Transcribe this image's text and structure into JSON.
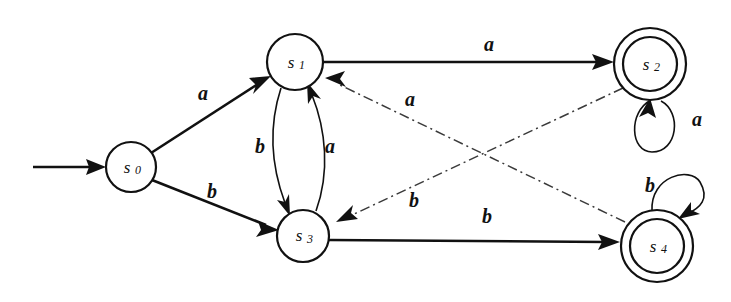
{
  "diagram": {
    "type": "state-transition-diagram",
    "alphabet": [
      "a",
      "b"
    ],
    "start_state": "s0",
    "accepting_states": [
      "s2",
      "s4"
    ]
  },
  "states": [
    {
      "id": "s0",
      "base": "s",
      "sub": "0",
      "cx": 131,
      "cy": 167,
      "r": 25,
      "accepting": false,
      "start": true
    },
    {
      "id": "s1",
      "base": "s",
      "sub": "1",
      "cx": 295,
      "cy": 62,
      "r": 28,
      "accepting": false,
      "start": false
    },
    {
      "id": "s2",
      "base": "s",
      "sub": "2",
      "cx": 650,
      "cy": 64,
      "r": 36,
      "accepting": true,
      "start": false
    },
    {
      "id": "s3",
      "base": "s",
      "sub": "3",
      "cx": 303,
      "cy": 236,
      "r": 26,
      "accepting": false,
      "start": false
    },
    {
      "id": "s4",
      "base": "s",
      "sub": "4",
      "cx": 657,
      "cy": 246,
      "r": 36,
      "accepting": true,
      "start": false
    }
  ],
  "transitions": [
    {
      "id": "t-s0-s1",
      "from": "s0",
      "to": "s1",
      "symbol": "a",
      "style": "solid",
      "shape": "straight",
      "label_x": 203,
      "label_y": 93
    },
    {
      "id": "t-s0-s3",
      "from": "s0",
      "to": "s3",
      "symbol": "b",
      "style": "solid",
      "shape": "straight",
      "label_x": 212,
      "label_y": 191
    },
    {
      "id": "t-s1-s2",
      "from": "s1",
      "to": "s2",
      "symbol": "a",
      "style": "solid",
      "shape": "straight",
      "label_x": 489,
      "label_y": 44
    },
    {
      "id": "t-s1-s3",
      "from": "s1",
      "to": "s3",
      "symbol": "b",
      "style": "thin",
      "shape": "curve-left",
      "label_x": 260,
      "label_y": 146
    },
    {
      "id": "t-s3-s1",
      "from": "s3",
      "to": "s1",
      "symbol": "a",
      "style": "thin",
      "shape": "curve-right",
      "label_x": 330,
      "label_y": 146
    },
    {
      "id": "t-s3-s4",
      "from": "s3",
      "to": "s4",
      "symbol": "b",
      "style": "solid",
      "shape": "straight",
      "label_x": 487,
      "label_y": 216
    },
    {
      "id": "t-s2-s2",
      "from": "s2",
      "to": "s2",
      "symbol": "a",
      "style": "thin",
      "shape": "self-loop-bottom",
      "label_x": 697,
      "label_y": 119
    },
    {
      "id": "t-s4-s4",
      "from": "s4",
      "to": "s4",
      "symbol": "b",
      "style": "thin",
      "shape": "self-loop-top",
      "label_x": 650,
      "label_y": 185
    },
    {
      "id": "t-s4-s1",
      "from": "s4",
      "to": "s1",
      "symbol": "a",
      "style": "dashdot",
      "shape": "straight",
      "label_x": 410,
      "label_y": 99
    },
    {
      "id": "t-s2-s3",
      "from": "s2",
      "to": "s3",
      "symbol": "b",
      "style": "dashdot",
      "shape": "straight",
      "label_x": 414,
      "label_y": 200
    }
  ],
  "start_marker": {
    "id": "start-arrow",
    "x1": 33,
    "y1": 167,
    "x2": 104,
    "y2": 167
  }
}
